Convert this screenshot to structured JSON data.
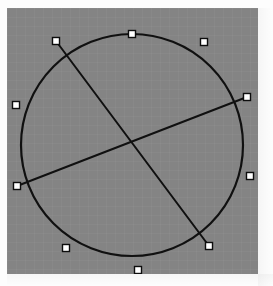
{
  "app": {
    "title": "Geometry Canvas",
    "background_color": "#fdfdfd"
  },
  "canvas": {
    "name": "drawing-canvas",
    "x": 7,
    "y": 8,
    "width": 251,
    "height": 266,
    "fill_color": "#848484",
    "grid_visible": true,
    "grid_spacing": 9
  },
  "figure": {
    "stroke_color": "#101010",
    "stroke_width": 2.2,
    "selected": true,
    "circle": {
      "name": "circle-shape",
      "label": "Circle",
      "cx": 125,
      "cy": 137,
      "r": 111,
      "fill": "none"
    },
    "chords": [
      {
        "name": "chord-a",
        "label": "Chord A",
        "x1": 49,
        "y1": 33,
        "x2": 202,
        "y2": 238
      },
      {
        "name": "chord-b",
        "label": "Chord B",
        "x1": 10,
        "y1": 178,
        "x2": 240,
        "y2": 89
      }
    ],
    "intersection": {
      "name": "chord-intersection-point",
      "label": "Center",
      "x": 125,
      "y": 137
    }
  },
  "handles": {
    "style": {
      "size": 7,
      "fill_color": "#ffffff",
      "stroke_color": "#0d0d0d",
      "stroke_width": 1.4
    },
    "items": [
      {
        "name": "handle-circle-top",
        "label": "Top",
        "x": 125,
        "y": 26,
        "target": "circle"
      },
      {
        "name": "handle-circle-top-right",
        "label": "Top Right",
        "x": 197,
        "y": 34,
        "target": "circle"
      },
      {
        "name": "handle-circle-right",
        "label": "Right",
        "x": 243,
        "y": 168,
        "target": "circle"
      },
      {
        "name": "handle-circle-bottom",
        "label": "Bottom",
        "x": 131,
        "y": 262,
        "target": "circle"
      },
      {
        "name": "handle-circle-bottom-left",
        "label": "Bottom Left",
        "x": 59,
        "y": 240,
        "target": "circle"
      },
      {
        "name": "handle-circle-left",
        "label": "Left",
        "x": 9,
        "y": 97,
        "target": "circle"
      },
      {
        "name": "handle-chord-a-start",
        "label": "Chord A Start",
        "x": 49,
        "y": 33,
        "target": "chord-a"
      },
      {
        "name": "handle-chord-a-end",
        "label": "Chord A End",
        "x": 202,
        "y": 238,
        "target": "chord-a"
      },
      {
        "name": "handle-chord-b-start",
        "label": "Chord B Start",
        "x": 10,
        "y": 178,
        "target": "chord-b"
      },
      {
        "name": "handle-chord-b-end",
        "label": "Chord B End",
        "x": 240,
        "y": 89,
        "target": "chord-b"
      }
    ]
  }
}
